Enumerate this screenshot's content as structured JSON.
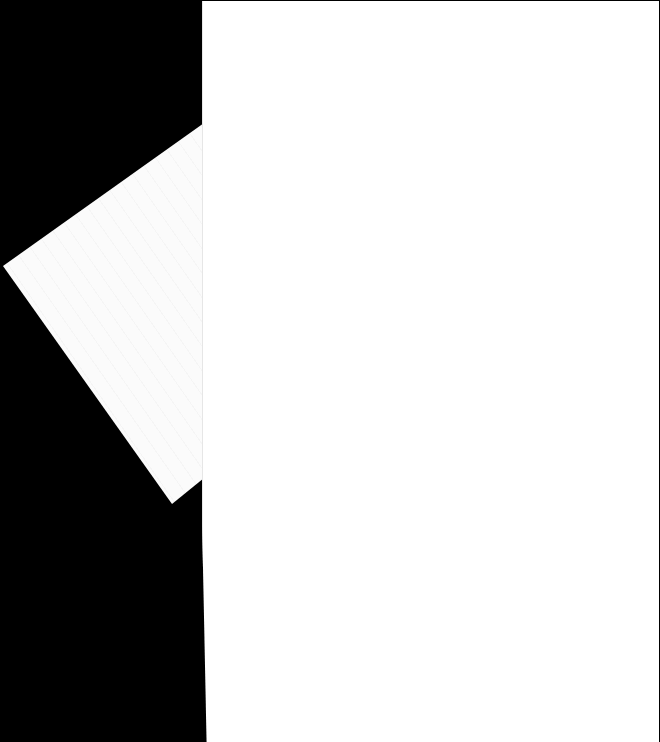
{
  "scene": {
    "description": "Two blank white paper sheets on a black background; one tilted sheet partially behind a larger upright sheet",
    "background_color": "#000000",
    "sheets": [
      {
        "name": "tilted-sheet",
        "color": "#fbfbfb",
        "content": ""
      },
      {
        "name": "main-sheet",
        "color": "#ffffff",
        "content": ""
      }
    ]
  }
}
